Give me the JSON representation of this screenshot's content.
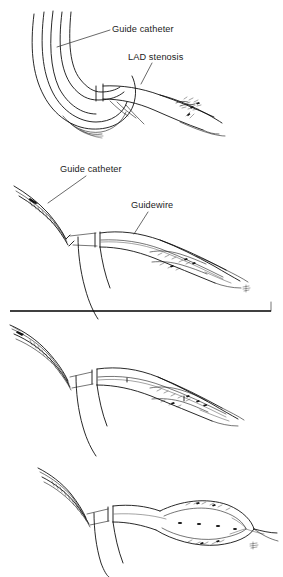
{
  "figure": {
    "type": "line-art-medical-illustration",
    "background_color": "#ffffff",
    "ink_color": "#111111",
    "width": 283,
    "height": 577,
    "panel_count": 4
  },
  "panels": [
    {
      "id": "panel-1",
      "order": 1,
      "caption": "Guide catheter engaged in coronary ostium; LAD stenosis visible",
      "labels": [
        {
          "id": "label-guide-catheter-1",
          "text": "Guide catheter",
          "x": 112,
          "y": 32,
          "leader": {
            "x1": 110,
            "y1": 30,
            "x2": 57,
            "y2": 47
          }
        },
        {
          "id": "label-lad-stenosis",
          "text": "LAD stenosis",
          "x": 128,
          "y": 60,
          "leader": {
            "x1": 152,
            "y1": 63,
            "x2": 141,
            "y2": 84
          }
        }
      ]
    },
    {
      "id": "panel-2",
      "order": 2,
      "caption": "Guidewire advanced across the stenosis",
      "labels": [
        {
          "id": "label-guide-catheter-2",
          "text": "Guide catheter",
          "x": 60,
          "y": 172,
          "leader": {
            "x1": 86,
            "y1": 176,
            "x2": 48,
            "y2": 203
          }
        },
        {
          "id": "label-guidewire",
          "text": "Guidewire",
          "x": 131,
          "y": 208,
          "leader": {
            "x1": 148,
            "y1": 212,
            "x2": 134,
            "y2": 234
          }
        }
      ]
    },
    {
      "id": "panel-3",
      "order": 3,
      "caption": "Balloon catheter tracked over the wire to the lesion",
      "labels": []
    },
    {
      "id": "panel-4",
      "order": 4,
      "caption": "Balloon inflated across the stenosis",
      "labels": []
    }
  ],
  "divider": {
    "id": "panel-divider",
    "y": 311,
    "x1": 10,
    "x2": 271,
    "tick_height": 9
  },
  "signatures": [
    {
      "id": "signature-panel-2",
      "text": "sig",
      "x": 243,
      "y": 289
    },
    {
      "id": "signature-panel-4",
      "text": "sig",
      "x": 250,
      "y": 546
    }
  ]
}
